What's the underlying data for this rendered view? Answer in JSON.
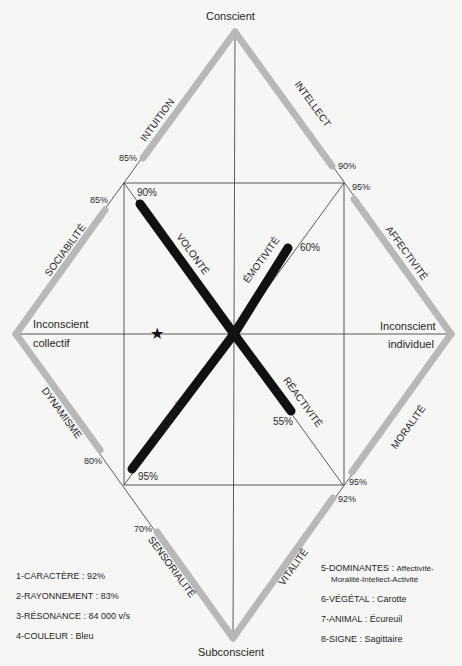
{
  "axes": {
    "top": "Conscient",
    "bottom": "Subconscient",
    "left_line1": "Inconscient",
    "left_line2": "collectif",
    "right_line1": "Inconscient",
    "right_line2": "individuel"
  },
  "outer_traits": [
    {
      "name": "INTUITION",
      "value": "85%"
    },
    {
      "name": "INTELLECT",
      "value": "90%"
    },
    {
      "name": "SOCIABILITÉ",
      "value": "85%"
    },
    {
      "name": "AFFECTIVITÉ",
      "value": "95%"
    },
    {
      "name": "DYNAMISME",
      "value": "80%"
    },
    {
      "name": "MORALITÉ",
      "value": "95%"
    },
    {
      "name": "SENSORIALITÉ",
      "value": "70%"
    },
    {
      "name": "VITALITÉ",
      "value": "92%"
    }
  ],
  "inner_traits": [
    {
      "name": "VOLONTÉ",
      "value": "90%"
    },
    {
      "name": "ÉMOTIVITÉ",
      "value": "60%"
    },
    {
      "name": "ACTIVITÉ",
      "value": "95%"
    },
    {
      "name": "RÉACTIVITÉ",
      "value": "55%"
    }
  ],
  "marker": {
    "icon": "star-icon",
    "glyph": "★"
  },
  "legend_left": [
    {
      "label": "1-CARACTÈRE",
      "value": "92%"
    },
    {
      "label": "2-RAYONNEMENT",
      "value": "83%"
    },
    {
      "label": "3-RÉSONANCE",
      "value": "84 000 v/s"
    },
    {
      "label": "4-COULEUR",
      "value": "Bleu"
    }
  ],
  "legend_right": [
    {
      "label": "5-DOMINANTES",
      "value": "Affectivité-",
      "value_cont": "Moralité-Intellect-Activité"
    },
    {
      "label": "6-VÉGÉTAL",
      "value": "Carotte"
    },
    {
      "label": "7-ANIMAL",
      "value": "Écureuil"
    },
    {
      "label": "8-SIGNE",
      "value": "Sagittaire"
    }
  ],
  "colors": {
    "gray_bar": "#b8b8b8",
    "black_bar": "#111111",
    "line": "#333333"
  }
}
